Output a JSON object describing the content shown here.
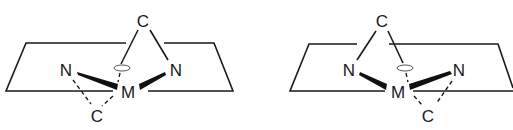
{
  "diagrams": [
    {
      "name": "left-complex",
      "atoms": {
        "top_c": "C",
        "left_n": "N",
        "right_n": "N",
        "metal": "M",
        "bottom_c": "C"
      }
    },
    {
      "name": "right-complex",
      "atoms": {
        "top_c": "C",
        "left_n": "N",
        "right_n": "N",
        "metal": "M",
        "bottom_c": "C"
      }
    }
  ],
  "colors": {
    "line": "#1a1a1a",
    "background": "#ffffff"
  }
}
